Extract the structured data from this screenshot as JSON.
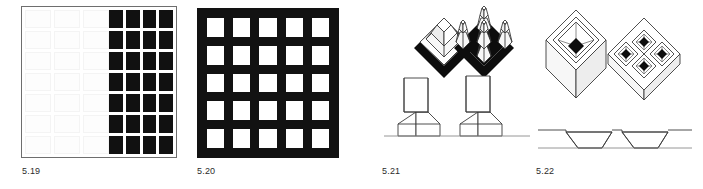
{
  "page": {
    "background_color": "#ffffff",
    "ink_color": "#111111",
    "line_color": "#3b3b3b",
    "figure_count": 4
  },
  "figures": [
    {
      "id": "5.19",
      "caption": "5.19",
      "description": "Square field diagram: bounded square frame with a grid of solid black squares filling the right portion and faint outlined squares on the left",
      "grid": {
        "solid_rows": 7,
        "solid_columns": 4,
        "solid_count": 28,
        "ghost_rows": 7,
        "ghost_columns": 3,
        "fill_color": "#111111",
        "frame_color": "#6e6e6e"
      }
    },
    {
      "id": "5.20",
      "caption": "5.20",
      "description": "Solid black square slab perforated by a regular grid of square white voids",
      "grid": {
        "rows": 5,
        "columns": 5,
        "void_count": 25,
        "slab_color": "#121212",
        "void_color": "#ffffff"
      }
    },
    {
      "id": "5.21",
      "caption": "5.21",
      "description": "Raised mass studies: axonometric of one truncated pyramid on a diamond plinth, axonometric of five clustered towers on a diamond plinth, and two elevation profiles of stepped tapering towers on a ground line",
      "views": [
        {
          "name": "axonometric-single-mass",
          "element_count": 1
        },
        {
          "name": "axonometric-clustered-mass",
          "element_count": 5
        },
        {
          "name": "elevation-left",
          "element_count": 1
        },
        {
          "name": "elevation-right",
          "element_count": 1
        }
      ]
    },
    {
      "id": "5.22",
      "caption": "5.22",
      "description": "Sunken court studies: axonometric of a cube with a single inverted pyramidal court, axonometric of a slab with four sunken diamond courts, and a section through two trapezoidal sunken pits",
      "views": [
        {
          "name": "axonometric-single-court",
          "court_count": 1
        },
        {
          "name": "axonometric-four-courts",
          "court_count": 4
        },
        {
          "name": "section-two-pits",
          "pit_count": 2
        }
      ]
    }
  ]
}
